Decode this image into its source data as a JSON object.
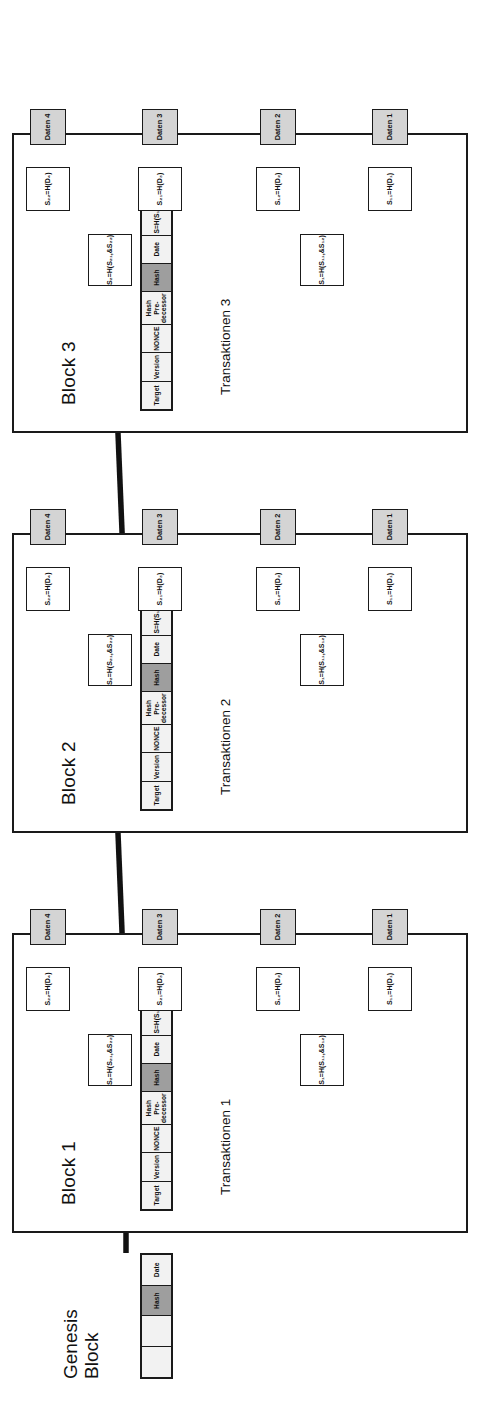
{
  "diagram": {
    "genesis": {
      "title_line1": "Genesis",
      "title_line2": "Block",
      "cells": [
        {
          "label": "",
          "style": "plain"
        },
        {
          "label": "",
          "style": "plain"
        },
        {
          "label": "Hash",
          "style": "gray"
        },
        {
          "label": "Date",
          "style": "plain"
        }
      ]
    },
    "header_cells": [
      {
        "label": "Target",
        "style": "plain"
      },
      {
        "label": "Version",
        "style": "plain"
      },
      {
        "label": "NONCE",
        "style": "plain"
      },
      {
        "label": "Hash Pre-decessor",
        "style": "plain"
      },
      {
        "label": "Hash",
        "style": "gray"
      },
      {
        "label": "Date",
        "style": "plain"
      },
      {
        "label": "S=H(S₁,&S₂)",
        "style": "plain"
      }
    ],
    "blocks": [
      {
        "title": "Block 1",
        "tx_label": "Transaktionen 1",
        "nodes": {
          "branch_left": "S₁=H(S₁₁,&S₁₂)",
          "branch_right": "S₂=H(S₂₁,&S₂₂)",
          "leaf_hashes": [
            "S₁₁=H(D₁)",
            "S₁₂=H(D₂)",
            "S₂₁=H(D₃)",
            "S₂₂=H(D₄)"
          ],
          "leaf_data": [
            "Daten 1",
            "Daten 2",
            "Daten 3",
            "Daten 4"
          ]
        }
      },
      {
        "title": "Block 2",
        "tx_label": "Transaktionen 2",
        "nodes": {
          "branch_left": "S₁=H(S₁₁,&S₁₂)",
          "branch_right": "S₂=H(S₂₁,&S₂₂)",
          "leaf_hashes": [
            "S₁₁=H(D₁)",
            "S₁₂=H(D₂)",
            "S₂₁=H(D₃)",
            "S₂₂=H(D₄)"
          ],
          "leaf_data": [
            "Daten 1",
            "Daten 2",
            "Daten 3",
            "Daten 4"
          ]
        }
      },
      {
        "title": "Block 3",
        "tx_label": "Transaktionen 3",
        "nodes": {
          "branch_left": "S₁=H(S₁₁,&S₁₂)",
          "branch_right": "S₂=H(S₂₁,&S₂₂)",
          "leaf_hashes": [
            "S₁₁=H(D₁)",
            "S₁₂=H(D₂)",
            "S₂₁=H(D₃)",
            "S₂₂=H(D₄)"
          ],
          "leaf_data": [
            "Daten 1",
            "Daten 2",
            "Daten 3",
            "Daten 4"
          ]
        }
      }
    ],
    "colors": {
      "hash_cell": "#9e9e9e",
      "data_cell": "#d4d4d4",
      "header_cell": "#f2f2f2",
      "stroke": "#1a1a1a"
    }
  }
}
